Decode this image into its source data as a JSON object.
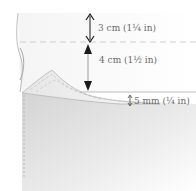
{
  "diagram": {
    "measurements": [
      {
        "id": "top",
        "label": "3 cm (1¼ in)"
      },
      {
        "id": "middle",
        "label": "4 cm (1½ in)"
      },
      {
        "id": "bottom",
        "label": "5 mm (¼ in)"
      }
    ],
    "colors": {
      "fabric_shade": "#d9d9d9",
      "fabric_light": "#f2f2f2",
      "arrow": "#1a1a1a",
      "guide_line": "#c8c8c8",
      "text": "#6b6b6b"
    }
  }
}
